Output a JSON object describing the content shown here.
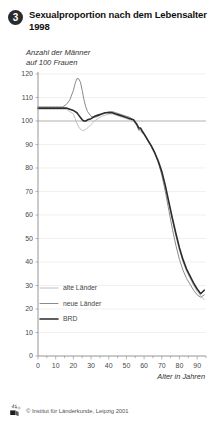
{
  "header": {
    "badge": "3",
    "title": "Sexualproportion nach dem Lebensalter 1998",
    "subtitle": "Anzahl der Männer\nauf 100 Frauen"
  },
  "footer": {
    "credit": "© Institut für Länderkunde, Leipzig 2001",
    "logo_icon": "institute-logo-icon"
  },
  "chart_data": {
    "type": "line",
    "title": "Sexualproportion nach dem Lebensalter 1998",
    "subtitle": "Anzahl der Männer auf 100 Frauen",
    "xlabel": "Alter in Jahren",
    "ylabel": "",
    "xlim": [
      0,
      95
    ],
    "ylim": [
      0,
      120
    ],
    "xticks": [
      0,
      10,
      20,
      30,
      40,
      50,
      60,
      70,
      80,
      90
    ],
    "yticks": [
      0,
      10,
      20,
      30,
      40,
      50,
      60,
      70,
      80,
      90,
      100,
      110,
      120
    ],
    "xtick_labels": [
      "0",
      "10",
      "20",
      "30",
      "40",
      "50",
      "60",
      "70",
      "80",
      "90"
    ],
    "ytick_labels": [
      "0",
      "10",
      "20",
      "30",
      "40",
      "50",
      "60",
      "70",
      "80",
      "90",
      "100",
      "110",
      "120"
    ],
    "grid": true,
    "reference_line": 100,
    "legend_position": "lower-left-inside",
    "x": [
      0,
      2,
      4,
      6,
      8,
      10,
      12,
      14,
      16,
      18,
      20,
      21,
      22,
      23,
      24,
      25,
      26,
      27,
      28,
      30,
      32,
      34,
      36,
      38,
      40,
      42,
      44,
      46,
      48,
      50,
      52,
      54,
      55,
      56,
      57,
      58,
      59,
      60,
      62,
      64,
      66,
      68,
      70,
      72,
      74,
      76,
      78,
      80,
      82,
      84,
      86,
      88,
      90,
      92,
      94
    ],
    "series": [
      {
        "name": "alte Länder",
        "color": "#b9b9b9",
        "width": 0.9,
        "values": [
          105,
          105,
          105,
          105,
          105,
          105,
          105,
          105,
          105,
          104,
          103,
          101,
          99,
          97.5,
          96.5,
          96,
          96,
          96.5,
          97,
          98.5,
          100,
          101,
          102,
          102.5,
          103,
          103,
          102.5,
          102,
          101.5,
          101,
          100.5,
          100,
          99,
          98,
          96.5,
          95.5,
          95,
          94,
          91.5,
          89,
          86,
          82,
          78,
          72,
          65,
          58,
          51,
          45,
          40,
          36,
          33,
          30,
          27.5,
          25.5,
          24
        ]
      },
      {
        "name": "neue Länder",
        "color": "#8a8a8a",
        "width": 1.0,
        "values": [
          106,
          106,
          106,
          106,
          106,
          106,
          106,
          106,
          107,
          109,
          113,
          116,
          118,
          118,
          116.5,
          113,
          109,
          106,
          104,
          102,
          101.5,
          102,
          103,
          103.5,
          104,
          104,
          103.5,
          103,
          102.5,
          102,
          101.5,
          100.5,
          99.5,
          98,
          96,
          97,
          96,
          94.5,
          92,
          89.5,
          86.5,
          82.5,
          77,
          70,
          62,
          54,
          47,
          41,
          36.5,
          33,
          30.5,
          28,
          26,
          25,
          26
        ]
      },
      {
        "name": "BRD",
        "color": "#2c2c2c",
        "width": 1.6,
        "values": [
          105.5,
          105.5,
          105.5,
          105.5,
          105.5,
          105.5,
          105.5,
          105.5,
          105.5,
          105,
          104.5,
          104,
          103.5,
          102.5,
          101.5,
          100.5,
          100,
          100,
          100.5,
          101,
          102,
          102.5,
          103,
          103.5,
          103.5,
          103.5,
          103,
          102.5,
          102,
          101.5,
          101,
          100.5,
          99.5,
          98.5,
          97,
          97,
          95.5,
          94.5,
          92,
          89.5,
          86.5,
          83,
          78.5,
          72.5,
          65.5,
          58.5,
          52,
          46,
          41,
          37,
          34,
          31,
          28.5,
          26.5,
          28
        ]
      }
    ],
    "legend": [
      {
        "label": "alte Länder",
        "color": "#b9b9b9",
        "width": 0.9
      },
      {
        "label": "neue Länder",
        "color": "#8a8a8a",
        "width": 1.0
      },
      {
        "label": "BRD",
        "color": "#2c2c2c",
        "width": 1.6
      }
    ]
  }
}
